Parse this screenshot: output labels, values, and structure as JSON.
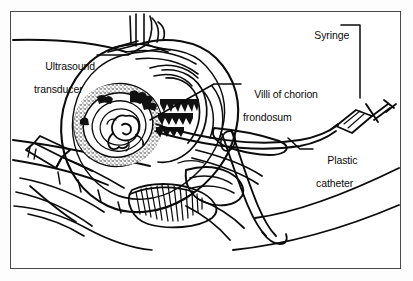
{
  "figure": {
    "kind": "medical-line-illustration",
    "border_color": "#4a4a4a",
    "ink_color": "#0b0b0b",
    "background_color": "#ffffff"
  },
  "labels": {
    "ultrasound": {
      "line1": "Ultrasound",
      "line2": "transducer"
    },
    "villi": {
      "line1": "Villi of chorion",
      "line2": "frondosum"
    },
    "syringe": {
      "line1": "Syringe"
    },
    "catheter": {
      "line1": "Plastic",
      "line2": "catheter"
    }
  },
  "anatomy_parts": [
    "abdominal-wall",
    "uterus",
    "gestational-sac",
    "fetus",
    "chorion-frondosum-villi",
    "cervix",
    "vagina",
    "bladder",
    "rectum",
    "fallopian-tube",
    "sacrum-spine"
  ],
  "instruments": [
    "ultrasound-transducer",
    "speculum",
    "plastic-catheter",
    "syringe"
  ]
}
